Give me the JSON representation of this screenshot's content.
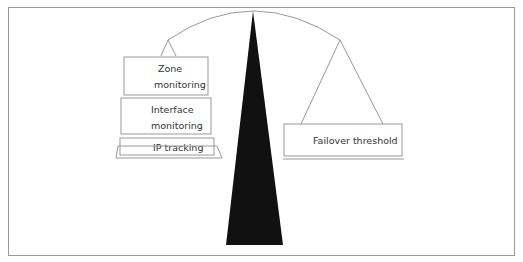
{
  "diagram": {
    "type": "balance-scale",
    "left_pan": {
      "stack": [
        {
          "label_lines": [
            "Zone",
            "monitoring"
          ]
        },
        {
          "label_lines": [
            "Interface",
            "monitoring"
          ]
        },
        {
          "label_lines": [
            "IP tracking"
          ]
        }
      ]
    },
    "right_pan": {
      "stack": [
        {
          "label_lines": [
            "Failover threshold"
          ]
        }
      ]
    },
    "colors": {
      "fulcrum": "#111111",
      "lines": "#888888",
      "frame": "#999999"
    }
  }
}
